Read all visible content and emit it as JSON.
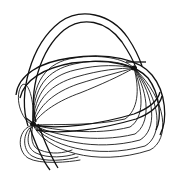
{
  "image": {
    "subject": "Line drawing of a woven rib basket with an arched handle",
    "background": "#ffffff",
    "stroke_color": "#1a1a1a"
  }
}
